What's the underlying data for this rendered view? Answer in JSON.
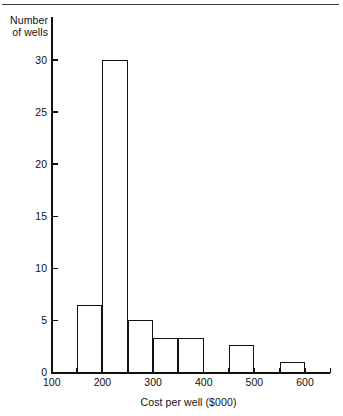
{
  "figure": {
    "top_rule": "page-rule",
    "ink_color": "#111111",
    "background": "#ffffff"
  },
  "chart_data": {
    "type": "bar",
    "title": "",
    "subtitle": "",
    "xlabel": "Cost per well ($000)",
    "ylabel": "Number\nof wells",
    "ylabel_lines": [
      "Number",
      "of wells"
    ],
    "grid": false,
    "legend": false,
    "legend_position": "none",
    "xlim": [
      100,
      650
    ],
    "ylim": [
      0,
      31
    ],
    "x_tick_values": [
      100,
      150,
      200,
      250,
      300,
      350,
      400,
      450,
      500,
      550,
      600,
      650
    ],
    "x_tick_labels": [
      "100",
      "",
      "200",
      "",
      "300",
      "",
      "400",
      "",
      "500",
      "",
      "600",
      ""
    ],
    "x_labeled_ticks": [
      "100",
      "200",
      "300",
      "400",
      "500",
      "600"
    ],
    "y_tick_values": [
      0,
      5,
      10,
      15,
      20,
      25,
      30
    ],
    "y_tick_labels": [
      "0",
      "5",
      "10",
      "15",
      "20",
      "25",
      "30"
    ],
    "bin_width": 50,
    "bins": [
      {
        "label": "150-200",
        "start": 150,
        "end": 200,
        "value": 6.5
      },
      {
        "label": "200-250",
        "start": 200,
        "end": 250,
        "value": 30
      },
      {
        "label": "250-300",
        "start": 250,
        "end": 300,
        "value": 5
      },
      {
        "label": "300-350",
        "start": 300,
        "end": 350,
        "value": 3.3
      },
      {
        "label": "350-400",
        "start": 350,
        "end": 400,
        "value": 3.3
      },
      {
        "label": "450-500",
        "start": 450,
        "end": 500,
        "value": 2.6
      },
      {
        "label": "550-600",
        "start": 550,
        "end": 600,
        "value": 1.0
      }
    ],
    "categories": [
      "150-200",
      "200-250",
      "250-300",
      "300-350",
      "350-400",
      "450-500",
      "550-600"
    ],
    "values": [
      6.5,
      30,
      5,
      3.3,
      3.3,
      2.6,
      1.0
    ]
  }
}
